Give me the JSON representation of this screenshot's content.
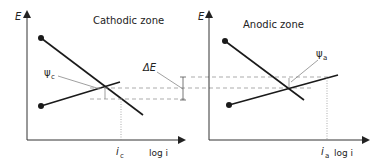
{
  "left_panel": {
    "title": "Cathodic zone",
    "y_axis_label": "E",
    "x_axis_label": "log i",
    "current_label": "i",
    "current_sub": "c",
    "psi_label": "ψ",
    "psi_sub": "c"
  },
  "right_panel": {
    "title": "Anodic zone",
    "y_axis_label": "E",
    "x_axis_label": "log i",
    "current_label": "i",
    "current_sub": "a",
    "psi_label": "ψ",
    "psi_sub": "a"
  },
  "delta_label": "ΔE",
  "colors": {
    "line": "#1a1a1a",
    "axis": "#333333",
    "dashed": "#888888",
    "leader": "#777777"
  }
}
